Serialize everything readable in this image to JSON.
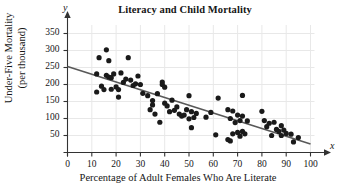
{
  "chart_data": {
    "type": "scatter",
    "title": "Literacy and Child Mortality",
    "xlabel": "Percentage of Adult Females Who Are Literate",
    "ylabel_line1": "Under-Five Mortality",
    "ylabel_line2": "(per thousand)",
    "x_axis_variable": "x",
    "y_axis_variable": "y",
    "xlim": [
      0,
      100
    ],
    "ylim": [
      0,
      375
    ],
    "xticks": [
      0,
      10,
      20,
      30,
      40,
      50,
      60,
      70,
      80,
      90,
      100
    ],
    "yticks": [
      50,
      100,
      150,
      200,
      250,
      300,
      350
    ],
    "grid": true,
    "legend": "none",
    "point_color": "#1a1a1a",
    "point_radius": 2.6,
    "trendline": {
      "label": "least-squares regression line",
      "color": "#595959",
      "x_start": 0,
      "y_start": 253,
      "x_end": 100,
      "y_end": 25
    },
    "points": [
      [
        12,
        231
      ],
      [
        12,
        178
      ],
      [
        13,
        279
      ],
      [
        14,
        195
      ],
      [
        15,
        185
      ],
      [
        16,
        302
      ],
      [
        16,
        227
      ],
      [
        17,
        270
      ],
      [
        17,
        222
      ],
      [
        18,
        220
      ],
      [
        18,
        186
      ],
      [
        19,
        231
      ],
      [
        20,
        193
      ],
      [
        21,
        163
      ],
      [
        21,
        185
      ],
      [
        22,
        234
      ],
      [
        23,
        206
      ],
      [
        24,
        216
      ],
      [
        25,
        279
      ],
      [
        26,
        213
      ],
      [
        27,
        197
      ],
      [
        28,
        202
      ],
      [
        29,
        225
      ],
      [
        30,
        200
      ],
      [
        31,
        174
      ],
      [
        33,
        167
      ],
      [
        34,
        126
      ],
      [
        35,
        153
      ],
      [
        35,
        140
      ],
      [
        36,
        113
      ],
      [
        37,
        173
      ],
      [
        38,
        89
      ],
      [
        39,
        207
      ],
      [
        39,
        200
      ],
      [
        40,
        192
      ],
      [
        40,
        145
      ],
      [
        41,
        137
      ],
      [
        42,
        120
      ],
      [
        43,
        154
      ],
      [
        44,
        124
      ],
      [
        45,
        134
      ],
      [
        46,
        113
      ],
      [
        47,
        107
      ],
      [
        48,
        110
      ],
      [
        49,
        126
      ],
      [
        50,
        167
      ],
      [
        50,
        99
      ],
      [
        51,
        120
      ],
      [
        51,
        73
      ],
      [
        52,
        103
      ],
      [
        53,
        115
      ],
      [
        57,
        104
      ],
      [
        59,
        118
      ],
      [
        61,
        52
      ],
      [
        62,
        160
      ],
      [
        66,
        126
      ],
      [
        66,
        38
      ],
      [
        67,
        100
      ],
      [
        67,
        34
      ],
      [
        68,
        122
      ],
      [
        68,
        55
      ],
      [
        69,
        88
      ],
      [
        70,
        59
      ],
      [
        70,
        110
      ],
      [
        71,
        94
      ],
      [
        71,
        48
      ],
      [
        72,
        168
      ],
      [
        72,
        107
      ],
      [
        72,
        62
      ],
      [
        73,
        55
      ],
      [
        74,
        93
      ],
      [
        80,
        121
      ],
      [
        81,
        94
      ],
      [
        82,
        76
      ],
      [
        83,
        86
      ],
      [
        84,
        50
      ],
      [
        85,
        89
      ],
      [
        86,
        68
      ],
      [
        87,
        62
      ],
      [
        88,
        79
      ],
      [
        88,
        50
      ],
      [
        89,
        66
      ],
      [
        90,
        56
      ],
      [
        92,
        54
      ],
      [
        93,
        31
      ],
      [
        95,
        44
      ]
    ]
  }
}
